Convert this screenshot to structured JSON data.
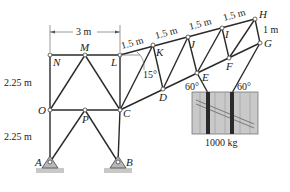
{
  "figure": {
    "type": "truss-diagram",
    "nodes": [
      {
        "id": "N",
        "label": "N",
        "x": 50,
        "y": 55
      },
      {
        "id": "M",
        "label": "M",
        "x": 85,
        "y": 55
      },
      {
        "id": "L",
        "label": "L",
        "x": 120,
        "y": 55
      },
      {
        "id": "O",
        "label": "O",
        "x": 50,
        "y": 110
      },
      {
        "id": "P",
        "label": "P",
        "x": 85,
        "y": 110
      },
      {
        "id": "C",
        "label": "C",
        "x": 120,
        "y": 110
      },
      {
        "id": "A",
        "label": "A",
        "x": 50,
        "y": 162
      },
      {
        "id": "B",
        "label": "B",
        "x": 118,
        "y": 162
      },
      {
        "id": "K",
        "label": "K",
        "x": 153,
        "y": 45
      },
      {
        "id": "J",
        "label": "J",
        "x": 188,
        "y": 37
      },
      {
        "id": "I",
        "label": "I",
        "x": 222,
        "y": 28
      },
      {
        "id": "H",
        "label": "H",
        "x": 255,
        "y": 19
      },
      {
        "id": "D",
        "label": "D",
        "x": 163,
        "y": 89
      },
      {
        "id": "E",
        "label": "E",
        "x": 197,
        "y": 73
      },
      {
        "id": "F",
        "label": "F",
        "x": 229,
        "y": 58
      },
      {
        "id": "G",
        "label": "G",
        "x": 260,
        "y": 43
      }
    ],
    "dimensions": {
      "top_span": "3 m",
      "upper_height": "2.25 m",
      "lower_height": "2.25 m",
      "boom_segments": [
        "1.5 m",
        "1.5 m",
        "1.5 m",
        "1.5 m"
      ],
      "end_depth": "1 m"
    },
    "angles": {
      "boom_angle": "15°",
      "left_cable": "60°",
      "right_cable": "60°"
    },
    "load": {
      "label": "1000 kg"
    }
  }
}
